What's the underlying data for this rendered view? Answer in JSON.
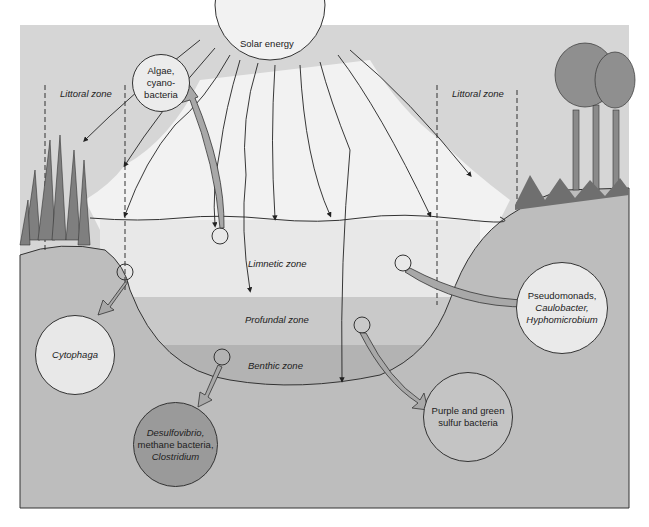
{
  "figure": {
    "sun": {
      "label": "Solar energy"
    },
    "zones": {
      "littoral_left": "Littoral zone",
      "littoral_right": "Littoral zone",
      "limnetic": "Limnetic zone",
      "profundal": "Profundal zone",
      "benthic": "Benthic zone"
    },
    "organisms": {
      "algae": {
        "line1": "Algae,",
        "line2": "cyano-",
        "line3": "bacteria"
      },
      "cytophaga": {
        "line1": "Cytophaga"
      },
      "pseudomonads": {
        "line1": "Pseudomonads,",
        "line2": "Caulobacter,",
        "line3": "Hyphomicrobium"
      },
      "purple_green": {
        "line1": "Purple and green",
        "line2": "sulfur bacteria"
      },
      "desulfovibrio": {
        "line1": "Desulfovibrio,",
        "line2": "methane bacteria,",
        "line3": "Clostridium"
      }
    },
    "colors": {
      "sky": "#d9d9d9",
      "light_wedge": "#f4f4f4",
      "limnetic": "#e6e6e6",
      "profundal": "#c8c8c8",
      "benthic": "#b4b4b4",
      "ground": "#bdbdbd",
      "vegetation": "#8a8a8a",
      "arrow": "#a8a8a8",
      "dark_circle": "#9a9a9a"
    }
  }
}
